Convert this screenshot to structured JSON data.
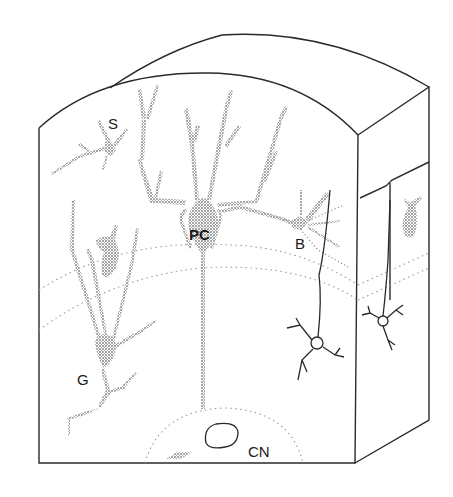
{
  "diagram": {
    "colors": {
      "outline": "#2a2a2a",
      "stipple": "#8a8a8a",
      "layer_boundary": "#9a9a9a",
      "background": "#ffffff"
    },
    "labels": [
      {
        "id": "S",
        "text": "S",
        "x": 108,
        "y": 116,
        "size": 15,
        "weight": "normal"
      },
      {
        "id": "PC",
        "text": "PC",
        "x": 188,
        "y": 227,
        "size": 15,
        "weight": "bold"
      },
      {
        "id": "B",
        "text": "B",
        "x": 295,
        "y": 236,
        "size": 15,
        "weight": "normal"
      },
      {
        "id": "G",
        "text": "G",
        "x": 77,
        "y": 372,
        "size": 15,
        "weight": "normal"
      },
      {
        "id": "CN",
        "text": "CN",
        "x": 248,
        "y": 444,
        "size": 15,
        "weight": "normal"
      }
    ],
    "cells": [
      {
        "id": "S",
        "name": "stellate cell"
      },
      {
        "id": "PC",
        "name": "Purkinje cell"
      },
      {
        "id": "B",
        "name": "basket cell"
      },
      {
        "id": "G",
        "name": "Golgi cell"
      },
      {
        "id": "CN",
        "name": "cerebellar nuclei"
      }
    ]
  }
}
